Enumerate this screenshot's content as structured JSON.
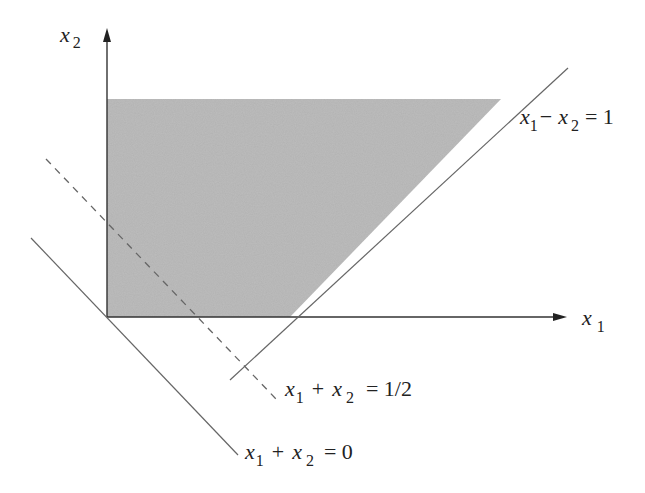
{
  "diagram": {
    "type": "feasible-region",
    "axes": {
      "x": {
        "label_var": "x",
        "label_sub": "1"
      },
      "y": {
        "label_var": "x",
        "label_sub": "2"
      }
    },
    "region": {
      "fill_color": "#bdbdbd",
      "description": "shaded unbounded feasible region above x-axis, right of y-axis, left of x1 - x2 = 1 (truncated at top)"
    },
    "lines": [
      {
        "id": "constraint",
        "style": "solid",
        "equation": "x1 - x2 = 1",
        "label": {
          "v1": "x",
          "s1": "1",
          "op": "−",
          "v2": "x",
          "s2": "2",
          "rhs": "= 1"
        }
      },
      {
        "id": "objective-half",
        "style": "dashed",
        "equation": "x1 + x2 = 1/2",
        "label": {
          "v1": "x",
          "s1": "1",
          "op": "+",
          "v2": "x",
          "s2": "2",
          "rhs": "= 1/2"
        }
      },
      {
        "id": "objective-zero",
        "style": "solid",
        "equation": "x1 + x2 = 0",
        "label": {
          "v1": "x",
          "s1": "1",
          "op": "+",
          "v2": "x",
          "s2": "2",
          "rhs": "= 0"
        }
      }
    ],
    "colors": {
      "axis": "#333333",
      "line": "#555555",
      "fill": "#bdbdbd"
    }
  }
}
